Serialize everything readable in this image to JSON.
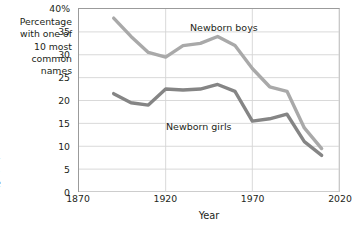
{
  "page_text": {
    "clipped_paragraph": "s. U.S.\nred the\n2006).\nedalist\no. I am\nomen's\ne is the\nf the"
  },
  "chart_data": {
    "type": "line",
    "title": "",
    "xlabel": "Year",
    "ylabel": "Percentage with one of 10 most common names",
    "ylabel_lines": [
      "Percentage",
      "with one of",
      "10 most",
      "common",
      "names"
    ],
    "xlim": [
      1870,
      2020
    ],
    "ylim": [
      0,
      40
    ],
    "xticks": [
      1870,
      1920,
      1970,
      2020
    ],
    "xtick_labels": [
      "1870",
      "1920",
      "1970",
      "2020"
    ],
    "yticks": [
      0,
      5,
      10,
      15,
      20,
      25,
      30,
      35,
      40
    ],
    "ytick_labels": [
      "0",
      "5",
      "10",
      "15",
      "20",
      "25",
      "30",
      "35",
      "40%"
    ],
    "grid": "horizontal-and-vertical",
    "legend_position": "inline-labels",
    "x": [
      1890,
      1900,
      1910,
      1920,
      1930,
      1940,
      1950,
      1960,
      1970,
      1980,
      1990,
      2000,
      2010
    ],
    "series": [
      {
        "name": "Newborn boys",
        "color": "#a9a9a9",
        "values": [
          38.0,
          34.0,
          30.5,
          29.5,
          32.0,
          32.5,
          34.0,
          32.0,
          27.0,
          23.0,
          22.0,
          14.0,
          9.5
        ]
      },
      {
        "name": "Newborn girls",
        "color": "#858585",
        "values": [
          21.5,
          19.5,
          19.0,
          22.5,
          22.3,
          22.5,
          23.5,
          22.0,
          15.5,
          16.0,
          17.0,
          11.0,
          8.0
        ]
      }
    ]
  },
  "colors": {
    "axis": "#9b9b9b",
    "grid": "#d4d4d4",
    "text": "#231f20",
    "boys": "#a9a9a9",
    "girls": "#858585"
  }
}
